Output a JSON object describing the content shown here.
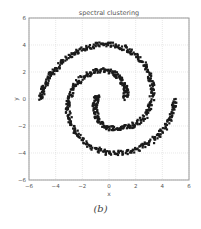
{
  "figure": {
    "caption": "(b)"
  },
  "chart_data": {
    "type": "scatter",
    "title": "spectral clustering",
    "xlabel": "x",
    "ylabel": "y",
    "xlim": [
      -6,
      6
    ],
    "ylim": [
      -6,
      6
    ],
    "xticks": [
      -6,
      -4,
      -2,
      0,
      2,
      4,
      6
    ],
    "yticks": [
      -6,
      -4,
      -2,
      0,
      2,
      4,
      6
    ],
    "xtick_labels": [
      "−6",
      "−4",
      "−2",
      "0",
      "2",
      "4",
      "6"
    ],
    "ytick_labels": [
      "−6",
      "−4",
      "−2",
      "0",
      "2",
      "4",
      "6"
    ],
    "grid": true,
    "legend": null,
    "marker_color": "#1a1a1a",
    "series": [
      {
        "name": "spiral-1",
        "color": "#1a1a1a",
        "points": [
          [
            -5.1,
            0.0
          ],
          [
            -5.0,
            0.5
          ],
          [
            -4.8,
            1.0
          ],
          [
            -4.5,
            1.6
          ],
          [
            -4.1,
            2.1
          ],
          [
            -3.6,
            2.6
          ],
          [
            -3.0,
            3.1
          ],
          [
            -2.4,
            3.5
          ],
          [
            -1.7,
            3.8
          ],
          [
            -1.0,
            4.0
          ],
          [
            -0.3,
            4.05
          ],
          [
            0.4,
            4.0
          ],
          [
            1.1,
            3.8
          ],
          [
            1.7,
            3.5
          ],
          [
            2.2,
            3.1
          ],
          [
            2.6,
            2.6
          ],
          [
            3.0,
            2.0
          ],
          [
            3.2,
            1.3
          ],
          [
            3.25,
            0.6
          ],
          [
            3.2,
            -0.1
          ],
          [
            3.0,
            -0.8
          ],
          [
            2.6,
            -1.4
          ],
          [
            2.1,
            -1.8
          ],
          [
            1.5,
            -2.05
          ],
          [
            0.9,
            -2.15
          ],
          [
            0.3,
            -2.2
          ],
          [
            -0.2,
            -2.05
          ],
          [
            -0.6,
            -1.8
          ],
          [
            -0.9,
            -1.4
          ],
          [
            -1.05,
            -0.9
          ],
          [
            -1.05,
            -0.4
          ],
          [
            -0.95,
            0.0
          ],
          [
            -0.85,
            0.2
          ]
        ]
      },
      {
        "name": "spiral-2",
        "color": "#1a1a1a",
        "points": [
          [
            1.2,
            0.1
          ],
          [
            1.3,
            0.5
          ],
          [
            1.2,
            0.9
          ],
          [
            1.0,
            1.3
          ],
          [
            0.7,
            1.7
          ],
          [
            0.3,
            1.95
          ],
          [
            -0.2,
            2.1
          ],
          [
            -0.8,
            2.1
          ],
          [
            -1.4,
            1.9
          ],
          [
            -2.0,
            1.6
          ],
          [
            -2.5,
            1.1
          ],
          [
            -2.85,
            0.5
          ],
          [
            -3.05,
            -0.2
          ],
          [
            -3.1,
            -0.9
          ],
          [
            -2.95,
            -1.6
          ],
          [
            -2.6,
            -2.3
          ],
          [
            -2.1,
            -2.9
          ],
          [
            -1.5,
            -3.4
          ],
          [
            -0.8,
            -3.8
          ],
          [
            0.0,
            -4.0
          ],
          [
            0.8,
            -4.0
          ],
          [
            1.6,
            -3.85
          ],
          [
            2.4,
            -3.6
          ],
          [
            3.1,
            -3.2
          ],
          [
            3.7,
            -2.7
          ],
          [
            4.2,
            -2.1
          ],
          [
            4.6,
            -1.4
          ],
          [
            4.85,
            -0.7
          ],
          [
            5.0,
            0.0
          ]
        ]
      }
    ]
  }
}
